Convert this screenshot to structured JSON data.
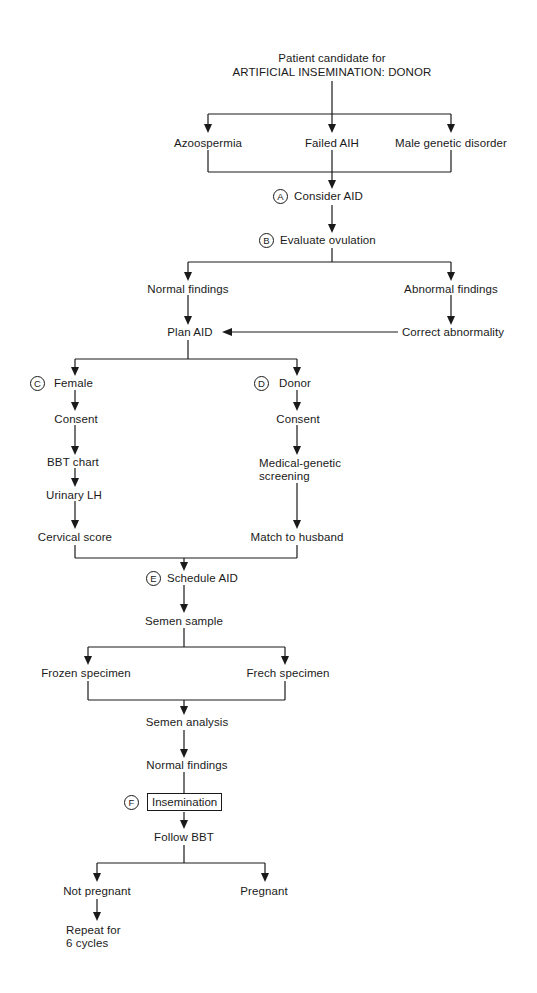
{
  "diagram": {
    "title_line1": "Patient candidate for",
    "title_line2": "ARTIFICIAL INSEMINATION: DONOR",
    "indications": {
      "azoospermia": "Azoospermia",
      "failed_aih": "Failed AIH",
      "male_genetic": "Male genetic disorder"
    },
    "step_a": {
      "marker": "A",
      "label": "Consider AID"
    },
    "step_b": {
      "marker": "B",
      "label": "Evaluate ovulation"
    },
    "ovulation": {
      "normal": "Normal findings",
      "abnormal": "Abnormal findings",
      "correct": "Correct abnormality",
      "plan": "Plan AID"
    },
    "female_branch": {
      "marker": "C",
      "label": "Female",
      "steps": [
        "Consent",
        "BBT chart",
        "Urinary LH",
        "Cervical score"
      ]
    },
    "donor_branch": {
      "marker": "D",
      "label": "Donor",
      "steps": [
        "Consent",
        "Medical-genetic",
        "screening",
        "Match to husband"
      ]
    },
    "step_e": {
      "marker": "E",
      "label": "Schedule AID"
    },
    "semen": {
      "sample": "Semen sample",
      "frozen": "Frozen specimen",
      "fresh": "Frech specimen",
      "analysis": "Semen analysis",
      "normal": "Normal findings"
    },
    "step_f": {
      "marker": "F",
      "label": "Insemination"
    },
    "follow": "Follow BBT",
    "outcomes": {
      "not_pregnant": "Not pregnant",
      "pregnant": "Pregnant",
      "repeat_line1": "Repeat for",
      "repeat_line2": "6 cycles"
    }
  }
}
